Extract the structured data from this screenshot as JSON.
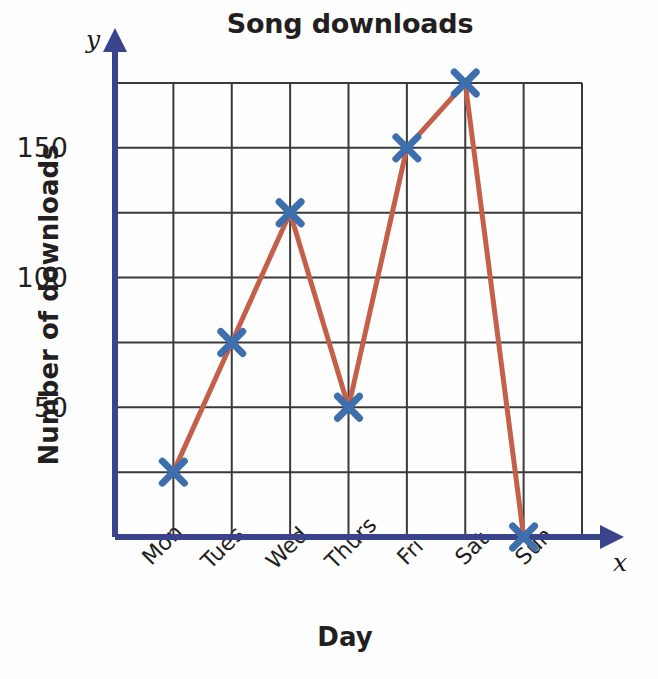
{
  "chart_data": {
    "type": "line",
    "title": "Song downloads",
    "xlabel": "Day",
    "ylabel": "Number of downloads",
    "x_axis_letter": "x",
    "y_axis_letter": "y",
    "categories": [
      "Mon",
      "Tues",
      "Wed",
      "Thurs",
      "Fri",
      "Sat",
      "Sun"
    ],
    "values": [
      25,
      75,
      125,
      50,
      150,
      175,
      0
    ],
    "ylim": [
      0,
      175
    ],
    "ytick_values": [
      0,
      25,
      50,
      75,
      100,
      125,
      150,
      175
    ],
    "ytick_labels": [
      "",
      "",
      "50",
      "",
      "100",
      "",
      "150",
      ""
    ],
    "ytick_labels_shown": [
      "50",
      "100",
      "150"
    ],
    "grid": true,
    "legend": "none",
    "marker": "x",
    "colors": {
      "line": "#c4604a",
      "marker": "#3d6faf",
      "axis": "#39448c",
      "grid": "#3a3a3a",
      "text": "#231f20",
      "background": "#fefefe"
    }
  },
  "labels": {
    "mon": "Mon",
    "tues": "Tues",
    "wed": "Wed",
    "thurs": "Thurs",
    "fri": "Fri",
    "sat": "Sat",
    "sun": "Sun",
    "y50": "50",
    "y100": "100",
    "y150": "150"
  }
}
